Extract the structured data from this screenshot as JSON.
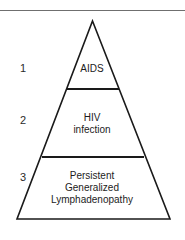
{
  "figure": {
    "kind": "pyramid-diagram",
    "background_color": "#ffffff",
    "line_color": "#1a1a1a",
    "rule_color": "#6f6f6f",
    "text_color": "#1c1c1c"
  },
  "top_rule": {
    "present": true
  },
  "pyramid": {
    "apex": {
      "x": 92.5,
      "y": 21
    },
    "base_left": {
      "x": 17,
      "y": 219
    },
    "base_right": {
      "x": 170,
      "y": 219
    },
    "dividers": [
      {
        "y": 89,
        "x1": 67,
        "x2": 119
      },
      {
        "y": 157,
        "x1": 42,
        "x2": 144
      }
    ],
    "tiers": [
      {
        "index": "1",
        "name": "aids",
        "lines": [
          "AIDS"
        ]
      },
      {
        "index": "2",
        "name": "hiv-infection",
        "lines": [
          "HIV",
          "infection"
        ]
      },
      {
        "index": "3",
        "name": "persistent-generalized-lymphadenopathy",
        "lines": [
          "Persistent",
          "Generalized",
          "Lymphadenopathy"
        ]
      }
    ]
  }
}
